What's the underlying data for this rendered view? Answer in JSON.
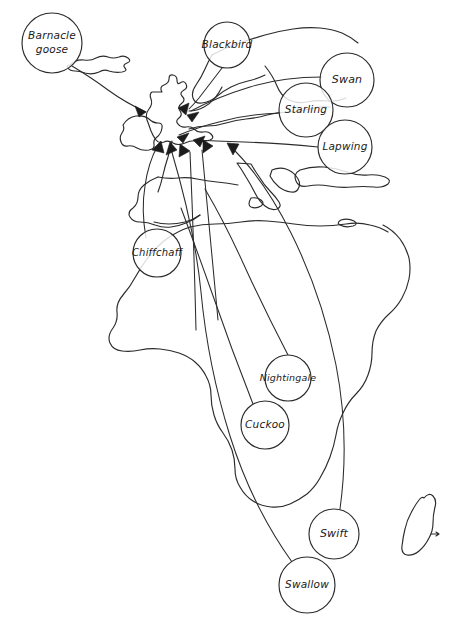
{
  "figure": {
    "kind": "hand-drawn-migration-map",
    "background_color": "#ffffff",
    "ink_color": "#2b2b2b",
    "arrow_color": "#1c1c1c",
    "width": 460,
    "height": 636
  },
  "regions": [
    {
      "name": "iceland"
    },
    {
      "name": "british-isles"
    },
    {
      "name": "ireland"
    },
    {
      "name": "scandinavia"
    },
    {
      "name": "western-europe"
    },
    {
      "name": "iberian-peninsula"
    },
    {
      "name": "italy"
    },
    {
      "name": "greece"
    },
    {
      "name": "turkey"
    },
    {
      "name": "crete"
    },
    {
      "name": "africa"
    },
    {
      "name": "madagascar"
    }
  ],
  "labels": [
    {
      "id": "barnacle-goose",
      "text": "Barnacle goose",
      "lines": [
        "Barnacle",
        "goose"
      ],
      "cx": 52,
      "cy": 43,
      "r": 30,
      "font_size": 10.5,
      "origin": "iceland"
    },
    {
      "id": "blackbird",
      "text": "Blackbird",
      "lines": [
        "Blackbird"
      ],
      "cx": 227,
      "cy": 45,
      "r": 23,
      "font_size": 10.5,
      "origin": "scandinavia"
    },
    {
      "id": "swan",
      "text": "Swan",
      "lines": [
        "Swan"
      ],
      "cx": 347,
      "cy": 80,
      "r": 27,
      "font_size": 11,
      "origin": "northern-russia"
    },
    {
      "id": "starling",
      "text": "Starling",
      "lines": [
        "Starling"
      ],
      "cx": 306,
      "cy": 110,
      "r": 27,
      "font_size": 10.5,
      "origin": "eastern-europe"
    },
    {
      "id": "lapwing",
      "text": "Lapwing",
      "lines": [
        "Lapwing"
      ],
      "cx": 345,
      "cy": 147,
      "r": 27,
      "font_size": 10.5,
      "origin": "eastern-europe"
    },
    {
      "id": "chiffchaff",
      "text": "Chiffchaff",
      "lines": [
        "Chiffchaff"
      ],
      "cx": 157,
      "cy": 253,
      "r": 24,
      "font_size": 10,
      "origin": "north-west-africa"
    },
    {
      "id": "nightingale",
      "text": "Nightingale",
      "lines": [
        "Nightingale"
      ],
      "cx": 288,
      "cy": 378,
      "r": 23,
      "font_size": 9.5,
      "origin": "west-africa"
    },
    {
      "id": "cuckoo",
      "text": "Cuckoo",
      "lines": [
        "Cuckoo"
      ],
      "cx": 265,
      "cy": 425,
      "r": 24,
      "font_size": 10.5,
      "origin": "central-africa"
    },
    {
      "id": "swift",
      "text": "Swift",
      "lines": [
        "Swift"
      ],
      "cx": 334,
      "cy": 534,
      "r": 25,
      "font_size": 11,
      "origin": "southern-africa"
    },
    {
      "id": "swallow",
      "text": "Swallow",
      "lines": [
        "Swallow"
      ],
      "cx": 307,
      "cy": 585,
      "r": 28,
      "font_size": 10.5,
      "origin": "south-africa"
    }
  ],
  "routes": [
    {
      "id": "route-barnacle-goose",
      "from": "barnacle-goose",
      "to": "scotland"
    },
    {
      "id": "route-blackbird",
      "from": "blackbird",
      "to": "england-north"
    },
    {
      "id": "route-swan",
      "from": "swan",
      "to": "england-east"
    },
    {
      "id": "route-starling",
      "from": "starling",
      "to": "england-east"
    },
    {
      "id": "route-lapwing",
      "from": "lapwing",
      "to": "england-south-east"
    },
    {
      "id": "route-chiffchaff",
      "from": "chiffchaff",
      "to": "england-south"
    },
    {
      "id": "route-nightingale",
      "from": "nightingale",
      "to": "england-south"
    },
    {
      "id": "route-cuckoo",
      "from": "cuckoo",
      "to": "england-south"
    },
    {
      "id": "route-swift",
      "from": "swift",
      "to": "england-south"
    },
    {
      "id": "route-swallow",
      "from": "swallow",
      "to": "england-south"
    }
  ]
}
